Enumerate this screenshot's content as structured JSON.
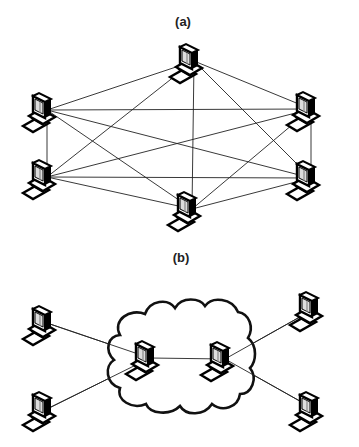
{
  "diagram": {
    "panel_a": {
      "label": "(a)",
      "description": "Fully connected mesh of 6 computers",
      "nodes": [
        {
          "id": "a1",
          "x": 194,
          "y": 61
        },
        {
          "id": "a2",
          "x": 47,
          "y": 110
        },
        {
          "id": "a3",
          "x": 311,
          "y": 109
        },
        {
          "id": "a4",
          "x": 47,
          "y": 177
        },
        {
          "id": "a5",
          "x": 311,
          "y": 178
        },
        {
          "id": "a6",
          "x": 192,
          "y": 209
        }
      ],
      "edges": [
        [
          "a1",
          "a2"
        ],
        [
          "a1",
          "a3"
        ],
        [
          "a1",
          "a4"
        ],
        [
          "a1",
          "a5"
        ],
        [
          "a1",
          "a6"
        ],
        [
          "a2",
          "a3"
        ],
        [
          "a2",
          "a4"
        ],
        [
          "a2",
          "a5"
        ],
        [
          "a2",
          "a6"
        ],
        [
          "a3",
          "a4"
        ],
        [
          "a3",
          "a5"
        ],
        [
          "a3",
          "a6"
        ],
        [
          "a4",
          "a5"
        ],
        [
          "a4",
          "a6"
        ],
        [
          "a5",
          "a6"
        ]
      ]
    },
    "panel_b": {
      "label": "(b)",
      "description": "Computers connected through a network cloud",
      "nodes": [
        {
          "id": "b1",
          "x": 47,
          "y": 323
        },
        {
          "id": "b2",
          "x": 47,
          "y": 409
        },
        {
          "id": "b3",
          "x": 150,
          "y": 358
        },
        {
          "id": "b4",
          "x": 225,
          "y": 359
        },
        {
          "id": "b5",
          "x": 314,
          "y": 309
        },
        {
          "id": "b6",
          "x": 314,
          "y": 409
        }
      ],
      "edges": [
        [
          "b1",
          "b3"
        ],
        [
          "b2",
          "b3"
        ],
        [
          "b3",
          "b4"
        ],
        [
          "b4",
          "b5"
        ],
        [
          "b4",
          "b6"
        ]
      ]
    },
    "icon": "desktop-computer-icon"
  }
}
